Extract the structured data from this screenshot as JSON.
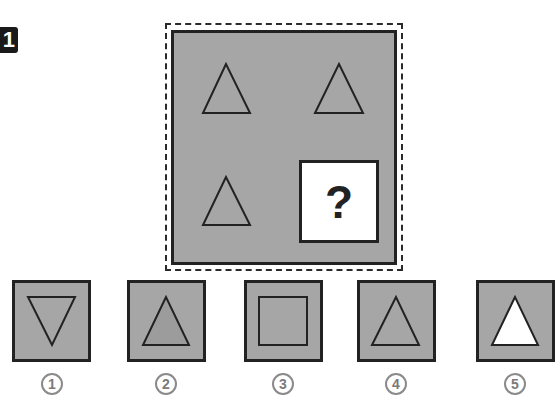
{
  "question": {
    "number": "1",
    "missing_marker": "?",
    "grid": {
      "background": "#a6a6a6",
      "cells": [
        {
          "position": "top-left",
          "shape": "triangle-up",
          "fill": "#a6a6a6"
        },
        {
          "position": "top-right",
          "shape": "triangle-up",
          "fill": "#a6a6a6"
        },
        {
          "position": "bottom-left",
          "shape": "triangle-up",
          "fill": "#a6a6a6"
        },
        {
          "position": "bottom-right",
          "shape": "question-mark-box"
        }
      ]
    }
  },
  "options": [
    {
      "label": "1",
      "shape": "triangle-down",
      "fill": "#a6a6a6"
    },
    {
      "label": "2",
      "shape": "triangle-up",
      "fill": "#9c9c9c"
    },
    {
      "label": "3",
      "shape": "square",
      "fill": "#a6a6a6"
    },
    {
      "label": "4",
      "shape": "triangle-up",
      "fill": "#a6a6a6"
    },
    {
      "label": "5",
      "shape": "triangle-up",
      "fill": "#ffffff"
    }
  ],
  "colors": {
    "panel_gray": "#a6a6a6",
    "stroke": "#222222",
    "number_gray": "#7a7a7a"
  }
}
